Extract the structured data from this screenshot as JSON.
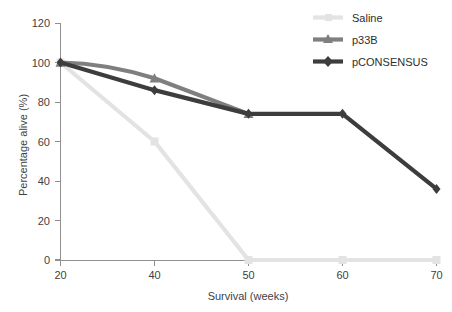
{
  "chart_data": {
    "type": "line",
    "title": "",
    "subtitle": "",
    "xlabel": "Survival (weeks)",
    "ylabel": "Percentage alive (%)",
    "x": [
      20,
      40,
      50,
      60,
      70
    ],
    "xticklabels": [
      "20",
      "40",
      "50",
      "60",
      "70"
    ],
    "yticks": [
      0,
      20,
      40,
      60,
      80,
      100,
      120
    ],
    "yticklabels": [
      "0",
      "20",
      "40",
      "60",
      "80",
      "100",
      "120"
    ],
    "ylim": [
      0,
      120
    ],
    "grid": false,
    "legend_position": "top-right",
    "series": [
      {
        "name": "Saline",
        "color": "#e3e3e3",
        "marker": "square",
        "x": [
          20,
          40,
          50,
          60,
          70
        ],
        "values": [
          100,
          60,
          0,
          0,
          0
        ]
      },
      {
        "name": "p33B",
        "color": "#7f7f7f",
        "marker": "triangle",
        "x": [
          20,
          40,
          50
        ],
        "values": [
          100,
          92,
          74
        ]
      },
      {
        "name": "pCONSENSUS",
        "color": "#3d3d3d",
        "marker": "diamond",
        "x": [
          20,
          40,
          50,
          60,
          70
        ],
        "values": [
          100,
          86,
          74,
          74,
          36
        ]
      }
    ]
  },
  "axes": {
    "y_title": "Percentage alive (%)",
    "x_title": "Survival (weeks)",
    "y_tick_0": "0",
    "y_tick_20": "20",
    "y_tick_40": "40",
    "y_tick_60": "60",
    "y_tick_80": "80",
    "y_tick_100": "100",
    "y_tick_120": "120",
    "x_tick_20": "20",
    "x_tick_40": "40",
    "x_tick_50": "50",
    "x_tick_60": "60",
    "x_tick_70": "70"
  },
  "legend": {
    "items": [
      {
        "label": "Saline",
        "color": "#e3e3e3"
      },
      {
        "label": "p33B",
        "color": "#7f7f7f"
      },
      {
        "label": "pCONSENSUS",
        "color": "#3d3d3d"
      }
    ]
  },
  "colors": {
    "saline": "#e3e3e3",
    "p33b": "#7f7f7f",
    "pconsensus": "#3d3d3d",
    "axis": "#909090",
    "text": "#3f3f3f",
    "background": "#ffffff"
  }
}
